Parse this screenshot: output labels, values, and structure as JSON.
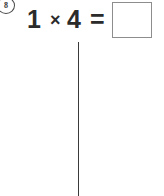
{
  "page": {
    "background_color": "#ffffff",
    "width": 164,
    "height": 196
  },
  "problem": {
    "number": "8",
    "number_badge_shape": "circle",
    "equation": {
      "factor_one": "1",
      "operator": "×",
      "operator_icon_name": "multiplication-icon",
      "factor_two": "4",
      "equals": "=",
      "answer_value": "",
      "answer_placeholder": ""
    },
    "text_color": "#2b2b2b",
    "answer_box": {
      "border_color": "#8d8d8d",
      "fill_color": "#ffffff"
    }
  },
  "divider": {
    "orientation": "vertical",
    "color": "#3a3a3a"
  }
}
